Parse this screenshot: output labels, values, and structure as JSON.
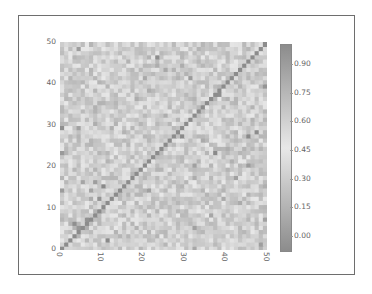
{
  "chart_data": {
    "type": "heatmap",
    "title": "",
    "xlabel": "",
    "ylabel": "",
    "rows": 50,
    "cols": 50,
    "diagonal_value": 1.0,
    "offdiagonal_typical": 0.5,
    "x_ticks": [
      "0",
      "10",
      "20",
      "30",
      "40",
      "50"
    ],
    "y_ticks": [
      "0",
      "10",
      "20",
      "30",
      "40",
      "50"
    ],
    "xlim": [
      0,
      50
    ],
    "ylim": [
      0,
      50
    ],
    "colorbar": {
      "ticks": [
        "0.00",
        "0.15",
        "0.30",
        "0.45",
        "0.60",
        "0.75",
        "0.90"
      ],
      "range": [
        -0.06,
        1.0
      ],
      "colormap": "diverging (rendered grayscale: dark ends, light middle)"
    },
    "grid": false,
    "legend": "colorbar right"
  },
  "colors": {
    "frame": "#6e6e6e",
    "cell_mid": "#a9a9a9",
    "diagonal": "#8a8a8a",
    "cbar_end": "#8c8c8c",
    "cbar_mid": "#e8e8e8"
  }
}
